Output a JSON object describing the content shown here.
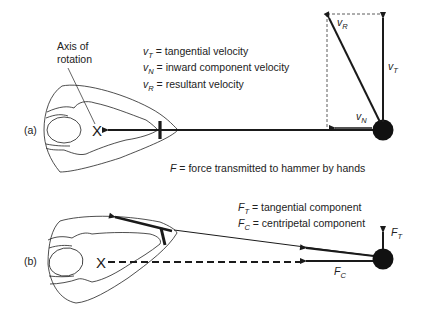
{
  "figure": {
    "panel_a": {
      "label": "(a)",
      "axis_label_line1": "Axis of",
      "axis_label_line2": "rotation",
      "axis_marker": "X",
      "legend": [
        {
          "symbol": "v",
          "sub": "T",
          "text": " = tangential velocity"
        },
        {
          "symbol": "v",
          "sub": "N",
          "text": " = inward component velocity"
        },
        {
          "symbol": "v",
          "sub": "R",
          "text": " = resultant velocity"
        }
      ],
      "vector_labels": {
        "vR": {
          "symbol": "v",
          "sub": "R"
        },
        "vT": {
          "symbol": "v",
          "sub": "T"
        },
        "vN": {
          "symbol": "v",
          "sub": "N"
        }
      }
    },
    "force_caption": {
      "symbol": "F",
      "text": " = force transmitted to hammer by hands"
    },
    "panel_b": {
      "label": "(b)",
      "axis_marker": "X",
      "legend": [
        {
          "symbol": "F",
          "sub": "T",
          "text": " = tangential component"
        },
        {
          "symbol": "F",
          "sub": "C",
          "text": " = centripetal component"
        }
      ],
      "vector_labels": {
        "FT": {
          "symbol": "F",
          "sub": "T"
        },
        "FC": {
          "symbol": "F",
          "sub": "C"
        }
      }
    },
    "colors": {
      "ink": "#1a1a1a",
      "background": "#ffffff"
    }
  }
}
